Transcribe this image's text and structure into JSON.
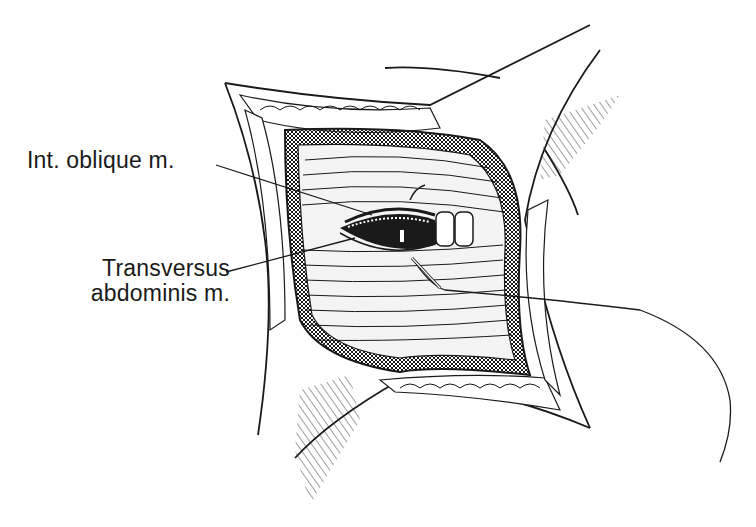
{
  "figure": {
    "style": "black-ink line drawing",
    "colors": {
      "ink": "#1a1a1a",
      "background": "#ffffff"
    }
  },
  "labels": [
    {
      "id": "int-oblique",
      "text": "Int. oblique m."
    },
    {
      "id": "transversus",
      "line1": "Transversus",
      "line2": "abdominis m."
    }
  ]
}
